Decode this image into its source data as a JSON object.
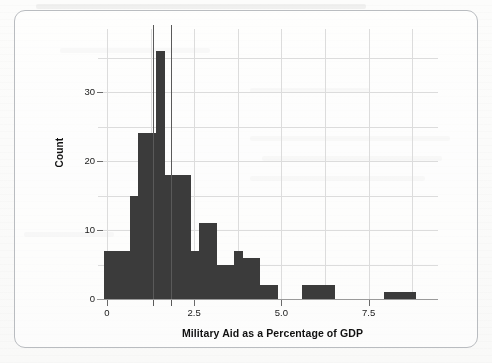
{
  "figure": {
    "frame_border_color": "#b9bcc0",
    "background_color": "#fdfdfc"
  },
  "chart_data": {
    "type": "bar",
    "subtype": "histogram",
    "title": "",
    "xlabel": "Military Aid as a Percentage of GDP",
    "ylabel": "Count",
    "bar_color": "#3b3b3b",
    "grid": true,
    "grid_color": "#d4d4d4",
    "legend": "none",
    "xlim": [
      -0.35,
      9.5
    ],
    "ylim": [
      0,
      37.8
    ],
    "xticks": [
      0,
      2.5,
      5.0,
      7.5
    ],
    "xtick_labels": [
      "0",
      "2.5",
      "5.0",
      "7.5"
    ],
    "yticks": [
      0,
      10,
      20,
      30
    ],
    "ytick_labels": [
      "0",
      "10",
      "20",
      "30"
    ],
    "bin_width": 0.25,
    "bins": [
      {
        "x0": -0.1,
        "x1": 0.15,
        "count": 7
      },
      {
        "x0": 0.15,
        "x1": 0.4,
        "count": 7
      },
      {
        "x0": 0.4,
        "x1": 0.65,
        "count": 7
      },
      {
        "x0": 0.65,
        "x1": 0.9,
        "count": 15
      },
      {
        "x0": 0.9,
        "x1": 1.15,
        "count": 24
      },
      {
        "x0": 1.15,
        "x1": 1.4,
        "count": 24
      },
      {
        "x0": 1.4,
        "x1": 1.65,
        "count": 36
      },
      {
        "x0": 1.65,
        "x1": 1.9,
        "count": 18
      },
      {
        "x0": 1.9,
        "x1": 2.15,
        "count": 18
      },
      {
        "x0": 2.15,
        "x1": 2.4,
        "count": 18
      },
      {
        "x0": 2.4,
        "x1": 2.65,
        "count": 7
      },
      {
        "x0": 2.65,
        "x1": 2.9,
        "count": 11
      },
      {
        "x0": 2.9,
        "x1": 3.15,
        "count": 11
      },
      {
        "x0": 3.15,
        "x1": 3.4,
        "count": 5
      },
      {
        "x0": 3.4,
        "x1": 3.65,
        "count": 5
      },
      {
        "x0": 3.65,
        "x1": 3.9,
        "count": 7
      },
      {
        "x0": 3.9,
        "x1": 4.15,
        "count": 6
      },
      {
        "x0": 4.15,
        "x1": 4.4,
        "count": 6
      },
      {
        "x0": 4.4,
        "x1": 4.65,
        "count": 2
      },
      {
        "x0": 4.65,
        "x1": 4.9,
        "count": 2
      },
      {
        "x0": 5.6,
        "x1": 5.85,
        "count": 2
      },
      {
        "x0": 5.85,
        "x1": 6.1,
        "count": 2
      },
      {
        "x0": 6.1,
        "x1": 6.35,
        "count": 2
      },
      {
        "x0": 6.35,
        "x1": 6.55,
        "count": 2
      },
      {
        "x0": 7.95,
        "x1": 8.2,
        "count": 1
      },
      {
        "x0": 8.2,
        "x1": 8.45,
        "count": 1
      },
      {
        "x0": 8.45,
        "x1": 8.7,
        "count": 1
      },
      {
        "x0": 8.7,
        "x1": 8.85,
        "count": 1
      }
    ],
    "reference_lines": [
      {
        "x": 1.33,
        "color": "#555555",
        "note": "vertical marker line"
      },
      {
        "x": 1.84,
        "color": "#555555",
        "note": "vertical marker line"
      }
    ]
  }
}
